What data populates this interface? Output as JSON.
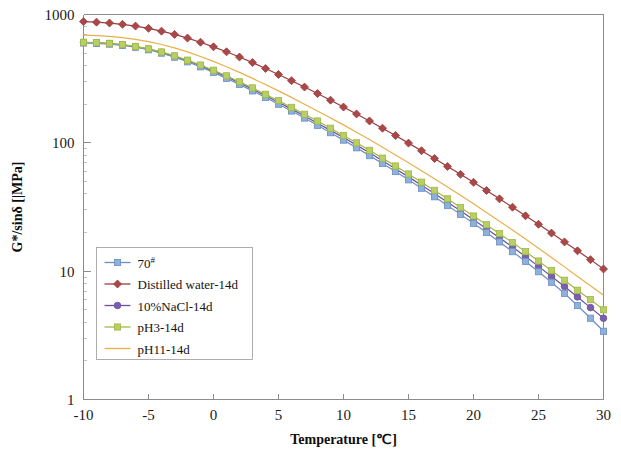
{
  "chart_data": {
    "type": "line",
    "title": "",
    "xlabel": "Temperature  [℃]",
    "ylabel": "G*/sinδ [|MPa]",
    "xlim": [
      -10,
      30
    ],
    "ylim": [
      1,
      1000
    ],
    "yscale": "log",
    "grid": false,
    "legend_position": "inner-left",
    "xticks": [
      -10,
      -5,
      0,
      5,
      10,
      15,
      20,
      25,
      30
    ],
    "xticklabels": [
      "-10",
      "-5",
      "0",
      "5",
      "10",
      "15",
      "20",
      "25",
      "30"
    ],
    "yticks": [
      1,
      10,
      100,
      1000
    ],
    "yticklabels": [
      "1",
      "10",
      "100",
      "1000"
    ],
    "x": [
      -10,
      -9,
      -8,
      -7,
      -6,
      -5,
      -4,
      -3,
      -2,
      -1,
      0,
      1,
      2,
      3,
      4,
      5,
      6,
      7,
      8,
      9,
      10,
      11,
      12,
      13,
      14,
      15,
      16,
      17,
      18,
      19,
      20,
      21,
      22,
      23,
      24,
      25,
      26,
      27,
      28,
      29,
      30
    ],
    "series": [
      {
        "name": "70#",
        "color": "#6a8fc4",
        "marker": "square",
        "marker_fill": "#8fb0da",
        "values": [
          600,
          596,
          588,
          575,
          556,
          531,
          500,
          465,
          428,
          391,
          354,
          318,
          285,
          254,
          226,
          200,
          177,
          156,
          137,
          120,
          105,
          91.5,
          79.5,
          69.0,
          59.7,
          51.5,
          44.3,
          38.0,
          32.5,
          27.7,
          23.6,
          20.0,
          16.9,
          14.2,
          11.9,
          9.9,
          8.2,
          6.7,
          5.4,
          4.3,
          3.4
        ]
      },
      {
        "name": "Distilled water-14d",
        "color": "#9c3b3b",
        "marker": "diamond",
        "marker_fill": "#a84848",
        "values": [
          880,
          872,
          858,
          838,
          812,
          780,
          742,
          700,
          655,
          608,
          560,
          512,
          466,
          422,
          380,
          341,
          305,
          272,
          242,
          215,
          190,
          168,
          148,
          130,
          114,
          99.5,
          86.8,
          75.5,
          65.5,
          56.8,
          49.2,
          42.5,
          36.6,
          31.5,
          27.0,
          23.2,
          19.8,
          16.9,
          14.4,
          12.3,
          10.4
        ]
      },
      {
        "name": "10%NaCl-14d",
        "color": "#6a4f9c",
        "marker": "circle",
        "marker_fill": "#7b5fae",
        "values": [
          605,
          601,
          593,
          580,
          561,
          537,
          507,
          473,
          436,
          399,
          362,
          327,
          293,
          262,
          233,
          207,
          183,
          162,
          142,
          125,
          110,
          96.0,
          83.6,
          72.5,
          62.8,
          54.3,
          46.8,
          40.2,
          34.5,
          29.5,
          25.2,
          21.4,
          18.2,
          15.4,
          13.0,
          10.9,
          9.1,
          7.6,
          6.3,
          5.2,
          4.3
        ]
      },
      {
        "name": "pH3-14d",
        "color": "#a0b845",
        "marker": "square",
        "marker_fill": "#b9cf63",
        "values": [
          608,
          604,
          596,
          583,
          564,
          540,
          511,
          477,
          441,
          404,
          368,
          333,
          299,
          268,
          239,
          213,
          189,
          167,
          148,
          130,
          114,
          100,
          87.4,
          76.0,
          66.0,
          57.2,
          49.4,
          42.6,
          36.6,
          31.4,
          26.9,
          23.0,
          19.6,
          16.7,
          14.2,
          12.0,
          10.1,
          8.5,
          7.1,
          6.0,
          5.0
        ]
      },
      {
        "name": "pH11-14d",
        "color": "#e8b04b",
        "marker": "none",
        "marker_fill": "#e8b04b",
        "values": [
          690,
          685,
          676,
          661,
          641,
          615,
          584,
          549,
          511,
          471,
          431,
          392,
          354,
          318,
          285,
          254,
          226,
          200,
          177,
          156,
          138,
          121,
          106,
          92.5,
          80.5,
          70.0,
          60.7,
          52.5,
          45.3,
          39.0,
          33.5,
          28.7,
          24.5,
          20.9,
          17.8,
          15.1,
          12.8,
          10.8,
          9.1,
          7.7,
          6.5
        ]
      }
    ]
  },
  "legend": {
    "items": [
      {
        "label_main": "70",
        "label_sup": "#"
      },
      {
        "label_main": "Distilled water-14d",
        "label_sup": ""
      },
      {
        "label_main": "10%NaCl-14d",
        "label_sup": ""
      },
      {
        "label_main": "pH3-14d",
        "label_sup": ""
      },
      {
        "label_main": "pH11-14d",
        "label_sup": ""
      }
    ]
  }
}
